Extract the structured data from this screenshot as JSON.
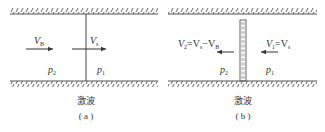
{
  "panels": [
    {
      "id": "a",
      "caption": "激波",
      "panel_label": "( a )",
      "left_region": {
        "pressure": "p",
        "pressure_sub": "2",
        "velocity": "V",
        "velocity_sub": "B",
        "arrow_direction": "right"
      },
      "right_region": {
        "pressure": "p",
        "pressure_sub": "1",
        "velocity": "V",
        "velocity_sub": "s",
        "arrow_direction": "right"
      },
      "shock_style": "line"
    },
    {
      "id": "b",
      "caption": "激波",
      "panel_label": "( b )",
      "left_region": {
        "pressure": "p",
        "pressure_sub": "2",
        "velocity_expr": [
          "V",
          "2",
          "=V",
          "s",
          "−V",
          "B"
        ],
        "arrow_direction": "left"
      },
      "right_region": {
        "pressure": "p",
        "pressure_sub": "1",
        "velocity_expr": [
          "V",
          "1",
          "=V",
          "s"
        ],
        "arrow_direction": "left"
      },
      "shock_style": "stationary-band"
    }
  ],
  "colors": {
    "ink": "#333333",
    "wall": "#555555"
  }
}
